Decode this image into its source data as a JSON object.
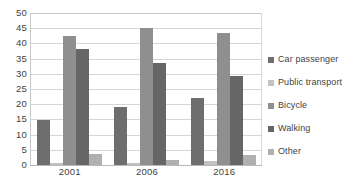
{
  "chart_data": {
    "type": "bar",
    "title": "",
    "xlabel": "",
    "ylabel": "",
    "categories": [
      "2001",
      "2006",
      "2016"
    ],
    "ylim": [
      0,
      50
    ],
    "yticks": [
      50,
      45,
      40,
      35,
      30,
      25,
      20,
      15,
      10,
      5,
      0
    ],
    "grid": true,
    "legend_position": "right",
    "series": [
      {
        "name": "Car passenger",
        "color": "#6e6e6e",
        "values": [
          14.8,
          19.0,
          22.0
        ]
      },
      {
        "name": "Public transport",
        "color": "#c2c2c2",
        "values": [
          0.5,
          0.8,
          1.4
        ]
      },
      {
        "name": "Bicycle",
        "color": "#8f8f8f",
        "values": [
          42.5,
          45.0,
          43.5
        ]
      },
      {
        "name": "Walking",
        "color": "#666666",
        "values": [
          38.2,
          33.7,
          29.4
        ]
      },
      {
        "name": "Other",
        "color": "#b0b0b0",
        "values": [
          3.5,
          1.6,
          3.2
        ]
      }
    ]
  },
  "legend": {
    "items": [
      {
        "label": "Car passenger"
      },
      {
        "label": "Public transport"
      },
      {
        "label": "Bicycle"
      },
      {
        "label": "Walking"
      },
      {
        "label": "Other"
      }
    ]
  },
  "axes": {
    "y_labels": [
      "50",
      "45",
      "40",
      "35",
      "30",
      "25",
      "20",
      "15",
      "10",
      "5",
      "0"
    ],
    "x_labels": [
      "2001",
      "2006",
      "2016"
    ]
  }
}
